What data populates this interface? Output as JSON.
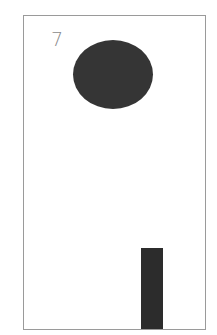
{
  "card": {
    "number_label": "7",
    "shapes": [
      {
        "type": "ellipse",
        "color": "#353535"
      },
      {
        "type": "bar",
        "color": "#2c2c2c"
      }
    ],
    "border_color": "#9a9a9a"
  }
}
